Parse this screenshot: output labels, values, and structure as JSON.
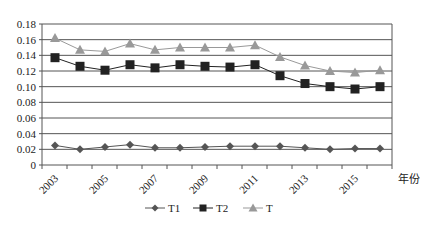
{
  "chart_data": {
    "type": "line",
    "title": "",
    "xlabel": "年份",
    "ylabel": "",
    "ylim": [
      0,
      0.18
    ],
    "yticks": [
      "0",
      "0.02",
      "0.04",
      "0.06",
      "0.08",
      "0.10",
      "0.12",
      "0.14",
      "0.16",
      "0.18"
    ],
    "x": [
      2003,
      2004,
      2005,
      2006,
      2007,
      2008,
      2009,
      2010,
      2011,
      2012,
      2013,
      2014,
      2015,
      2016
    ],
    "xtick_labels": [
      "2003",
      "2005",
      "2007",
      "2009",
      "2011",
      "2013",
      "2015"
    ],
    "grid": true,
    "legend_position": "bottom",
    "series": [
      {
        "name": "T1",
        "marker": "diamond",
        "color": "#555555",
        "values": [
          0.025,
          0.02,
          0.023,
          0.026,
          0.022,
          0.022,
          0.023,
          0.024,
          0.024,
          0.024,
          0.022,
          0.02,
          0.021,
          0.021
        ]
      },
      {
        "name": "T2",
        "marker": "square",
        "color": "#222222",
        "values": [
          0.137,
          0.126,
          0.121,
          0.128,
          0.124,
          0.128,
          0.126,
          0.125,
          0.128,
          0.114,
          0.104,
          0.1,
          0.097,
          0.1
        ]
      },
      {
        "name": "T",
        "marker": "triangle",
        "color": "#999999",
        "values": [
          0.162,
          0.147,
          0.145,
          0.155,
          0.147,
          0.15,
          0.15,
          0.15,
          0.153,
          0.138,
          0.127,
          0.12,
          0.118,
          0.121
        ]
      }
    ]
  }
}
